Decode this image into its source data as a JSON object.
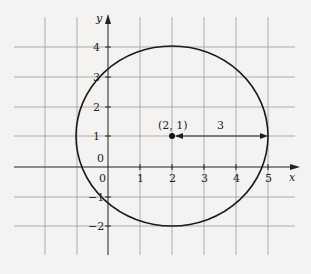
{
  "figure": {
    "type": "circle-on-coordinate-grid",
    "axes": {
      "x_label": "x",
      "y_label": "y",
      "x_ticks": [
        "0",
        "1",
        "2",
        "3",
        "4",
        "5"
      ],
      "y_ticks": [
        "4",
        "3",
        "2",
        "1",
        "0",
        "−1",
        "−2"
      ]
    },
    "circle": {
      "center_label": "(2, 1)",
      "radius_label": "3",
      "center": [
        2,
        1
      ],
      "radius": 3
    },
    "colors": {
      "grid": "#9a9a9a",
      "axis": "#222222",
      "curve": "#1a1a1a",
      "background": "#f4f3f1"
    }
  }
}
